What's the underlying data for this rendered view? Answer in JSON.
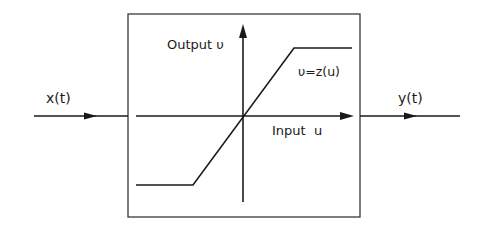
{
  "diagram": {
    "type": "block-diagram-saturation-nonlinearity",
    "input_signal": {
      "label": "x(t)"
    },
    "output_signal": {
      "label": "y(t)"
    },
    "block": {
      "y_axis_label": "Output υ",
      "x_axis_label": "Input  u",
      "function_label": "υ=z(u)",
      "characteristic": "saturation: flat low, linear ramp through origin, flat high"
    }
  },
  "colors": {
    "line": "#1a1a1a",
    "box_border": "#3a3a3a",
    "background": "#ffffff"
  }
}
